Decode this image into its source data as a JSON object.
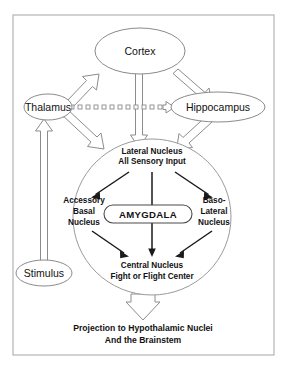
{
  "diagram": {
    "frame": {
      "name": "outer-border"
    },
    "nodes": {
      "cortex": {
        "label": "Cortex"
      },
      "thalamus": {
        "label": "Thalamus"
      },
      "hippocampus": {
        "label": "Hippocampus"
      },
      "stimulus": {
        "label": "Stimulus"
      },
      "amygdala": {
        "label": "AMYGDALA"
      }
    },
    "inner_nuclei": {
      "lateral": {
        "line1": "Lateral Nucleus",
        "line2": "All Sensory Input"
      },
      "accessory_basal": {
        "line1": "Accessory",
        "line2": "Basal",
        "line3": "Nucleus"
      },
      "baso_lateral": {
        "line1": "Baso-",
        "line2": "Lateral",
        "line3": "Nucleus"
      },
      "central": {
        "line1": "Central Nucleus",
        "line2": "Fight or Flight Center"
      }
    },
    "output": {
      "line1": "Projection to Hypothalamic Nuclei",
      "line2": "And the Brainstem"
    },
    "colors": {
      "background": "#ffffff",
      "frame_stroke": "#b4b4b4",
      "node_stroke": "#8a8a8a",
      "hollow_arrow_stroke": "#8c8c8c",
      "solid_arrow": "#1a1a1a",
      "text": "#111111"
    },
    "connections": [
      {
        "name": "thalamus-to-cortex",
        "style": "hollow-arrow"
      },
      {
        "name": "cortex-to-hippocampus",
        "style": "hollow-arrow"
      },
      {
        "name": "cortex-to-lateral-nucleus",
        "style": "hollow-arrow"
      },
      {
        "name": "thalamus-to-lateral-nucleus",
        "style": "hollow-arrow"
      },
      {
        "name": "hippocampus-to-lateral-nucleus",
        "style": "hollow-arrow"
      },
      {
        "name": "thalamus-to-hippocampus",
        "style": "dotted-square-hollow-arrow"
      },
      {
        "name": "stimulus-to-thalamus",
        "style": "hollow-arrow"
      },
      {
        "name": "lateral-to-accessory-basal",
        "style": "solid-arrow"
      },
      {
        "name": "lateral-to-central",
        "style": "solid-arrow"
      },
      {
        "name": "lateral-to-baso-lateral",
        "style": "solid-arrow"
      },
      {
        "name": "accessory-basal-to-central",
        "style": "solid-arrow"
      },
      {
        "name": "baso-lateral-to-central",
        "style": "solid-arrow"
      },
      {
        "name": "central-to-projection",
        "style": "hollow-arrow"
      }
    ]
  }
}
